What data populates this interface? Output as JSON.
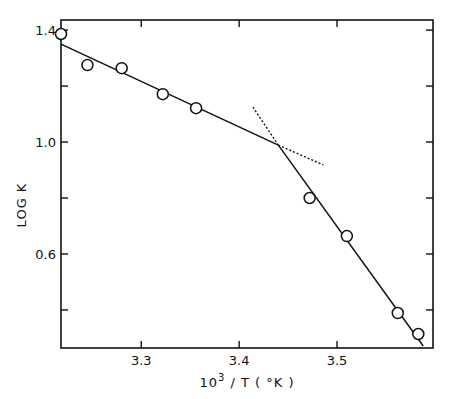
{
  "chart_data": {
    "type": "scatter",
    "title": "",
    "xlabel": "10^3 / T (°K)",
    "xlabel_parts": {
      "base": "10",
      "sup": "3",
      "rest": " / T  ( °K )"
    },
    "ylabel": "LOG K",
    "xlim": [
      3.218,
      3.598
    ],
    "ylim": [
      0.264,
      1.436
    ],
    "x_ticks": [
      3.3,
      3.4,
      3.5
    ],
    "x_tick_labels": [
      "3.3",
      "3.4",
      "3.5"
    ],
    "y_ticks": [
      0.4,
      0.6,
      0.8,
      1.0,
      1.2,
      1.4
    ],
    "y_tick_labels": [
      "",
      "0.6",
      "",
      "1.0",
      "",
      "1.4"
    ],
    "grid": false,
    "legend": null,
    "series": [
      {
        "name": "data",
        "marker": "open-circle",
        "x": [
          3.218,
          3.245,
          3.28,
          3.322,
          3.356,
          3.472,
          3.51,
          3.562,
          3.583
        ],
        "y": [
          1.386,
          1.275,
          1.264,
          1.171,
          1.121,
          0.8,
          0.664,
          0.389,
          0.314
        ]
      }
    ],
    "fit_lines": [
      {
        "name": "low-T fit",
        "style": "solid",
        "x": [
          3.218,
          3.44
        ],
        "y": [
          1.35,
          0.989
        ]
      },
      {
        "name": "high-T fit",
        "style": "solid",
        "x": [
          3.44,
          3.588
        ],
        "y": [
          0.989,
          0.271
        ]
      },
      {
        "name": "high-T extrapolation",
        "style": "dotted",
        "x": [
          3.414,
          3.44
        ],
        "y": [
          1.125,
          0.989
        ]
      },
      {
        "name": "low-T extrapolation",
        "style": "dotted",
        "x": [
          3.44,
          3.486
        ],
        "y": [
          0.989,
          0.918
        ]
      }
    ]
  }
}
